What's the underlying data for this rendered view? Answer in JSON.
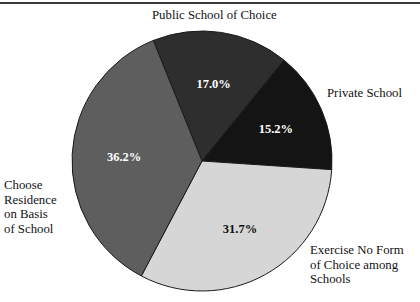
{
  "chart": {
    "top_rule": true,
    "geometry": {
      "center_x": 202,
      "center_y": 161,
      "radius": 130,
      "start_angle_deg": -22
    }
  },
  "labels": {
    "public_school": "Public School of Choice",
    "private_school": "Private School",
    "exercise_l1": "Exercise No Form",
    "exercise_l2": "of Choice among",
    "exercise_l3": "Schools",
    "choose_l1": "Choose",
    "choose_l2": "Residence",
    "choose_l3": "on Basis",
    "choose_l4": "of School"
  },
  "values": {
    "public_school": "17.0%",
    "private_school": "15.2%",
    "exercise": "31.7%",
    "choose_residence": "36.2%"
  },
  "colors": {
    "public_school": "#2e2e2e",
    "private_school": "#141414",
    "exercise": "#d6d6d6",
    "choose_residence": "#5e5e5e",
    "outline": "#1a1a1a",
    "background": "#ffffff",
    "rule": "#3b3b3b"
  },
  "chart_data": {
    "type": "pie",
    "title": "",
    "subtitle": "",
    "xlabel": "",
    "ylabel": "",
    "legend_position": "callout-labels",
    "grid": false,
    "labels": [
      "Public School of Choice",
      "Private School",
      "Exercise No Form of Choice among Schools",
      "Choose Residence on Basis of School"
    ],
    "values": [
      17.0,
      15.2,
      31.7,
      36.2
    ],
    "value_labels": [
      "17.0%",
      "15.2%",
      "31.7%",
      "36.2%"
    ],
    "units": "percent",
    "total": 100.1,
    "slice_colors": [
      "#2e2e2e",
      "#141414",
      "#d6d6d6",
      "#5e5e5e"
    ],
    "start_angle_deg": -22,
    "direction": "clockwise",
    "series": [
      {
        "name": "Share of respondents",
        "values": [
          17.0,
          15.2,
          31.7,
          36.2
        ]
      }
    ]
  }
}
